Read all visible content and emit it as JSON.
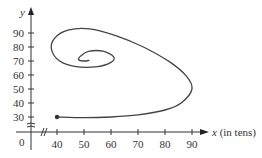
{
  "chart_data": {
    "type": "line",
    "title": "",
    "xlabel": "x (in tens)",
    "ylabel": "y",
    "x_ticks": [
      40,
      50,
      60,
      70,
      80,
      90
    ],
    "y_ticks": [
      30,
      40,
      50,
      60,
      70,
      80,
      90
    ],
    "origin_label": "0",
    "axis_breaks": [
      "x",
      "y"
    ],
    "xlim": [
      0,
      100
    ],
    "ylim": [
      0,
      100
    ],
    "grid": false,
    "series": [
      {
        "name": "trajectory",
        "description": "Curve starting at marked point (40, 30), sweeping right to about x=90, curving up and back left across the top near y=93, then spiraling inward toward an equilibrium near (50, 70)",
        "start_point": [
          40,
          30
        ],
        "x": [
          40,
          50,
          60,
          70,
          80,
          86,
          90,
          88,
          82,
          72,
          62,
          52,
          44,
          39,
          38,
          41,
          47,
          55,
          60,
          61,
          57,
          52,
          49,
          48,
          50,
          52
        ],
        "y": [
          30,
          29.5,
          30,
          31.5,
          35,
          40,
          50,
          59,
          69,
          80,
          88,
          93,
          92,
          86,
          78,
          70,
          66,
          66,
          69,
          73,
          77,
          77,
          74,
          71,
          70,
          70.5
        ]
      }
    ]
  }
}
